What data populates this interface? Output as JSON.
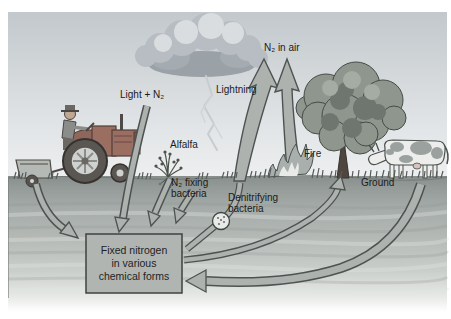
{
  "figure": {
    "type": "diagram",
    "labels": {
      "light_n2": "Light + N₂",
      "lightning": "Lightning",
      "n2_in_air": "N₂ in air",
      "alfalfa": "Alfalfa",
      "fire": "Fire",
      "n2_fixing_bacteria": "N₂ fixing\nbacteria",
      "denitrifying_bacteria": "Denitrifying\nbacteria",
      "ground": "Ground",
      "fixed_nitrogen_box": [
        "Fixed nitrogen",
        "in various",
        "chemical forms"
      ]
    },
    "colors": {
      "sky_top": "#c2c8cc",
      "sky_bottom": "#edeff0",
      "soil_dark": "#878e8c",
      "soil_mid": "#a4aaa7",
      "arrow_fill": "#adb2af",
      "arrow_outline": "#4d5351",
      "box_fill": "#b0b5b2",
      "box_border": "#3e4341",
      "tractor_body": "#9b6e62",
      "tree_foliage": "#8e968e",
      "text": "#1b1b1b"
    }
  }
}
